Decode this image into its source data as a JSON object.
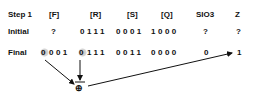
{
  "header": {
    "step": "Step 1",
    "cols": [
      "[F]",
      "[R]",
      "[S]",
      "[Q]",
      "SIO3",
      "Z"
    ]
  },
  "rows": [
    {
      "label": "Initial",
      "F": "?",
      "R": "0111",
      "S": "0001",
      "Q": "1000",
      "SIO3": "?",
      "Z": "?"
    },
    {
      "label": "Final",
      "F": "0001",
      "R": "0111",
      "S": "0011",
      "Q": "0000",
      "SIO3": "0",
      "Z": "1"
    }
  ],
  "final_F": {
    "highlighted_bit": "0",
    "rest": "001"
  },
  "final_R": {
    "highlighted_bit": "0",
    "rest": "111"
  },
  "operator": {
    "symbol": "⊕",
    "name": "xor"
  },
  "colors": {
    "text": "#111111",
    "highlight": "#bdbdbd",
    "arrow": "#111111"
  }
}
